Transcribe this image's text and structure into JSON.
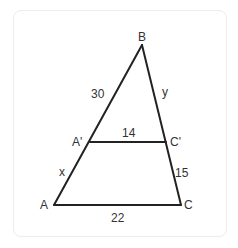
{
  "figure": {
    "type": "similar-triangles",
    "vertices": {
      "B": {
        "label": "B",
        "x": 142,
        "y": 45
      },
      "A_prime": {
        "label": "A'",
        "x": 90,
        "y": 142
      },
      "C_prime": {
        "label": "C'",
        "x": 166,
        "y": 142
      },
      "A": {
        "label": "A",
        "x": 54,
        "y": 205
      },
      "C": {
        "label": "C",
        "x": 181,
        "y": 205
      }
    },
    "segments": {
      "BA_prime": "30",
      "BC_prime": "y",
      "A_primeC_prime": "14",
      "A_primeA": "x",
      "C_primeC": "15",
      "AC": "22"
    },
    "stroke_color": "#222222"
  }
}
